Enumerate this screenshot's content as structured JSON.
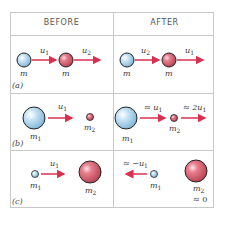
{
  "headers": {
    "before": "BEFORE",
    "after": "AFTER"
  },
  "rows": [
    {
      "tag": "(a)",
      "before": {
        "mass1": "m",
        "mass2": "m",
        "vel1": "u",
        "vel1_sub": "1",
        "vel2": "u",
        "vel2_sub": "2"
      },
      "after": {
        "mass1": "m",
        "mass2": "m",
        "vel1": "u",
        "vel1_sub": "2",
        "vel2": "u",
        "vel2_sub": "1"
      }
    },
    {
      "tag": "(b)",
      "before": {
        "mass1": "m",
        "mass1_sub": "1",
        "mass2": "m",
        "mass2_sub": "2",
        "vel1": "u",
        "vel1_sub": "1"
      },
      "after": {
        "mass1": "m",
        "mass1_sub": "1",
        "mass2": "m",
        "mass2_sub": "2",
        "vel1": "≈ u",
        "vel1_sub": "1",
        "vel2": "≈ 2u",
        "vel2_sub": "1"
      }
    },
    {
      "tag": "(c)",
      "before": {
        "mass1": "m",
        "mass1_sub": "1",
        "mass2": "m",
        "mass2_sub": "2",
        "vel1": "u",
        "vel1_sub": "1"
      },
      "after": {
        "mass1": "m",
        "mass1_sub": "1",
        "mass2": "m",
        "mass2_sub": "2",
        "vel1": "≈ −u",
        "vel1_sub": "1",
        "vel2_note": "≈ 0"
      }
    }
  ],
  "colors": {
    "blue_ball": "#b9dcf0",
    "pink_ball": "#e0707f",
    "arrow": "#d9304f",
    "grid": "#c8c8c8"
  }
}
